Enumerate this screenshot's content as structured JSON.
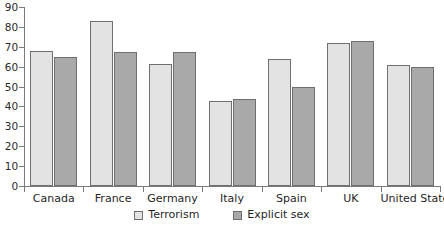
{
  "chart_data": {
    "type": "bar",
    "title": "",
    "subtitle": "",
    "xlabel": "",
    "ylabel": "",
    "ylim": [
      0,
      90
    ],
    "grid": false,
    "legend_position": "bottom-center",
    "y_ticks": [
      0,
      10,
      20,
      30,
      40,
      50,
      60,
      70,
      80,
      90
    ],
    "y_tick_labels": [
      "0",
      "10",
      "20",
      "30",
      "40",
      "50",
      "60",
      "70",
      "80",
      "90"
    ],
    "categories": [
      "Canada",
      "France",
      "Germany",
      "Italy",
      "Spain",
      "UK",
      "United States"
    ],
    "series": [
      {
        "name": "Terrorism",
        "color": "#e3e3e3",
        "values": [
          68,
          83,
          61.5,
          42.5,
          64,
          72,
          61
        ]
      },
      {
        "name": "Explicit sex",
        "color": "#a9a9a9",
        "values": [
          65,
          67.5,
          67.5,
          43.5,
          50,
          73,
          60
        ]
      }
    ]
  },
  "legend": {
    "items": [
      {
        "label": "Terrorism",
        "swatch": "terror"
      },
      {
        "label": "Explicit sex",
        "swatch": "sex"
      }
    ]
  },
  "colors": {
    "series_light": "#e3e3e3",
    "series_dark": "#a9a9a9",
    "axis": "#7a7a7a",
    "bar_outline": "#6f6f6f",
    "text": "#1f1f1f",
    "background": "#ffffff"
  }
}
